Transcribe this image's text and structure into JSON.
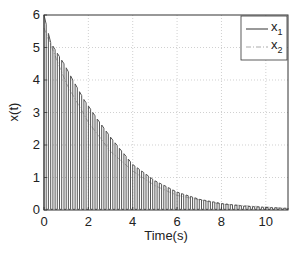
{
  "chart_data": {
    "type": "line",
    "title": "",
    "xlabel": "Time(s)",
    "ylabel": "x(t)",
    "xlim": [
      0,
      11
    ],
    "ylim": [
      0,
      6
    ],
    "xticks": [
      0,
      2,
      4,
      6,
      8,
      10
    ],
    "yticks": [
      0,
      1,
      2,
      3,
      4,
      5,
      6
    ],
    "grid": true,
    "legend_position": "upper right",
    "pulse_period": 0.2,
    "pulse_duty": 0.5,
    "series": [
      {
        "name": "x1",
        "label_main": "x",
        "label_sub": "1",
        "style": "solid",
        "color": "#555555",
        "envelope": {
          "x": [
            0,
            0.3,
            0.9,
            1.3,
            1.8,
            2.4,
            3.1,
            4.0,
            5.0,
            6.0,
            7.0,
            8.0,
            9.0,
            10.0,
            11.0
          ],
          "y": [
            6.0,
            5.15,
            4.5,
            4.0,
            3.4,
            2.8,
            2.15,
            1.4,
            0.9,
            0.55,
            0.33,
            0.2,
            0.12,
            0.08,
            0.05
          ]
        }
      },
      {
        "name": "x2",
        "label_main": "x",
        "label_sub": "2",
        "style": "dashdot",
        "color": "#aaaaaa",
        "envelope": {
          "x": [
            0,
            1,
            2,
            3,
            4,
            5,
            6,
            8,
            11
          ],
          "y": [
            5.6,
            3.9,
            2.7,
            1.8,
            1.2,
            0.75,
            0.45,
            0.18,
            0.05
          ]
        }
      }
    ]
  }
}
